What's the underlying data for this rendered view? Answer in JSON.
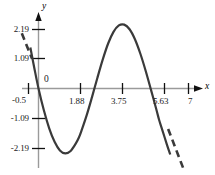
{
  "chart_data": {
    "type": "line",
    "title": "",
    "xlabel": "x",
    "ylabel": "y",
    "xlim": [
      -0.9,
      7.6
    ],
    "ylim": [
      -2.95,
      2.85
    ],
    "grid": false,
    "legend": null,
    "origin_label": "0",
    "xticks": [
      {
        "value": 1.88,
        "label": "1.88"
      },
      {
        "value": 3.75,
        "label": "3.75"
      },
      {
        "value": 5.63,
        "label": "5.63"
      },
      {
        "value": 7,
        "label": "7"
      }
    ],
    "yticks": [
      {
        "value": 2.19,
        "label": "2.19"
      },
      {
        "value": 1.09,
        "label": "1.09"
      },
      {
        "value": -1.09,
        "label": "-1.09"
      },
      {
        "value": -2.19,
        "label": "-2.19"
      }
    ],
    "extra_labels": [
      {
        "value": -0.5,
        "label": "-0.5",
        "axis": "x"
      }
    ],
    "series": [
      {
        "name": "solid-curve",
        "style": "solid",
        "color": "#3a3a3a",
        "x": [
          -0.38,
          -0.2,
          0.0,
          0.25,
          0.5,
          0.75,
          1.0,
          1.25,
          1.5,
          1.75,
          1.88,
          2.0,
          2.25,
          2.5,
          2.75,
          3.0,
          3.25,
          3.5,
          3.75,
          4.0,
          4.25,
          4.5,
          4.75,
          5.0,
          5.25,
          5.5,
          5.63,
          5.75,
          6.0,
          6.15
        ],
        "y": [
          1.52,
          0.78,
          0.0,
          -0.81,
          -1.48,
          -1.98,
          -2.3,
          -2.41,
          -2.32,
          -2.03,
          -1.83,
          -1.58,
          -0.99,
          -0.31,
          0.4,
          1.08,
          1.67,
          2.1,
          2.34,
          2.37,
          2.2,
          1.83,
          1.3,
          0.66,
          -0.05,
          -0.78,
          -1.17,
          -1.47,
          -2.1,
          -2.45
        ]
      },
      {
        "name": "dashed-left-segment",
        "style": "dashed",
        "color": "#3a3a3a",
        "x": [
          -0.78,
          -0.3
        ],
        "y": [
          2.05,
          1.1
        ]
      },
      {
        "name": "dashed-right-segment",
        "style": "dashed",
        "color": "#3a3a3a",
        "x": [
          6.05,
          6.75
        ],
        "y": [
          -1.5,
          -2.95
        ]
      }
    ]
  }
}
